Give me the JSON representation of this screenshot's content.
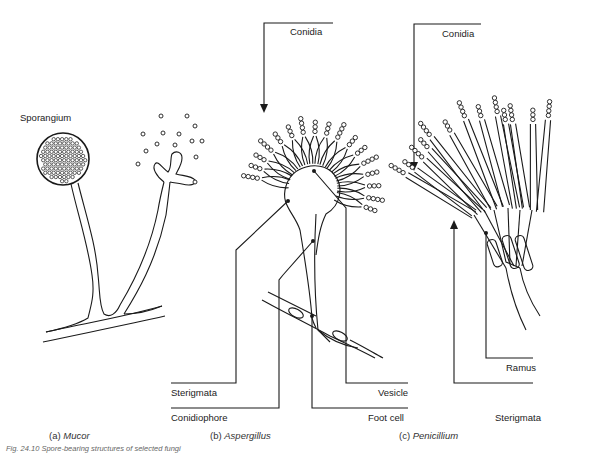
{
  "figure": {
    "caption": "Fig. 24.10 Spore-bearing structures of selected fungi",
    "panels": [
      {
        "id": "a",
        "caption_prefix": "(a)",
        "organism": "Mucor",
        "labels": [
          "Sporangium"
        ]
      },
      {
        "id": "b",
        "caption_prefix": "(b)",
        "organism": "Aspergillus",
        "labels": [
          "Conidia",
          "Sterigmata",
          "Conidiophore",
          "Vesicle",
          "Foot cell"
        ]
      },
      {
        "id": "c",
        "caption_prefix": "(c)",
        "organism": "Penicillium",
        "labels": [
          "Conidia",
          "Ramus",
          "Sterigmata"
        ]
      }
    ]
  },
  "colors": {
    "ink": "#1a1a1a",
    "background": "#ffffff"
  }
}
